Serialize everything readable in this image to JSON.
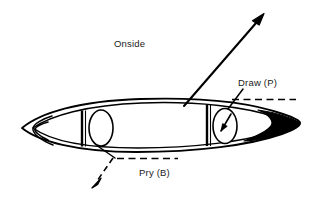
{
  "figure": {
    "type": "technical-line-diagram",
    "background_color": "#ffffff",
    "ink_color": "#000000"
  },
  "labels": {
    "onside": "Onside",
    "draw": "Draw (P)",
    "pry": "Pry (B)"
  },
  "annotations": {
    "onside_arrow": {
      "style": "solid",
      "direction": "up-right",
      "from": "stern-gunwale",
      "to": "offhull-upper-right"
    },
    "draw_arrow": {
      "style": "dashed",
      "direction": "right",
      "from": "bow-gunwale",
      "to": "offhull-right"
    },
    "pry_arrow": {
      "style": "dashed",
      "direction": "down-left",
      "from": "hull-bottom",
      "to": "offhull-lower-left"
    }
  },
  "hull": {
    "bow_tip_fill": "#000000",
    "stern_tip_fill": "#ffffff",
    "seats": 2,
    "seat_shape": "ellipse",
    "thwarts": 2,
    "paddler_arrow_in_bow_seat": true
  }
}
